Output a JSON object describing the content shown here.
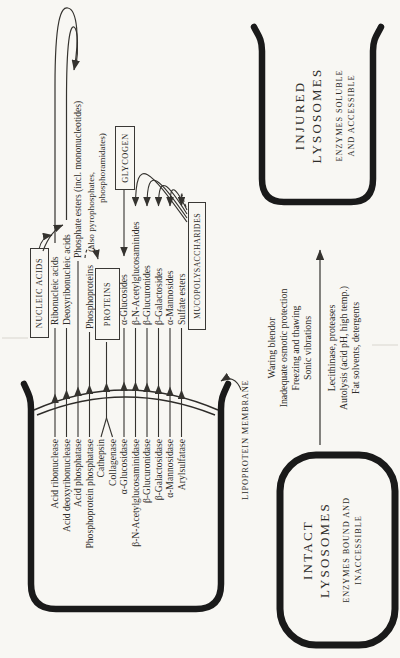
{
  "diagram": {
    "boxes": {
      "nucleic_acids": "NUCLEIC ACIDS",
      "proteins": "PROTEINS",
      "glycogen": "GLYCOGEN",
      "mucopolysaccharides": "MUCOPOLYSACCHARIDES"
    },
    "rows": [
      {
        "enzyme": "Acid ribonuclease",
        "substrate": "Ribonucleic acids"
      },
      {
        "enzyme": "Acid deoxyribonuclease",
        "substrate": "Deoxyribonucleic acids"
      },
      {
        "enzyme": "Acid phosphatase",
        "substrate": "Phosphate esters (incl. mononucleotides)"
      },
      {
        "enzyme": "Phosphoprotein phosphatase",
        "substrate": "Phosphoproteins"
      },
      {
        "enzyme": "Cathepsin",
        "substrate": ""
      },
      {
        "enzyme": "Collagenase",
        "substrate": ""
      },
      {
        "enzyme": "α-Glucosidase",
        "substrate": "α-Glucosides"
      },
      {
        "enzyme": "β-N-Acetylglucosaminidase",
        "substrate": "β-N-Acetylglucosaminides"
      },
      {
        "enzyme": "β-Glucuronidase",
        "substrate": "β-Glucuronides"
      },
      {
        "enzyme": "β-Galactosidase",
        "substrate": "β-Galactosides"
      },
      {
        "enzyme": "α-Mannosidase",
        "substrate": "α-Mannosides"
      },
      {
        "enzyme": "Arylsulfatase",
        "substrate": "Sulfate esters"
      }
    ],
    "phosphate_note1": "(also pyrophosphates,",
    "phosphate_note2": "phosphoramidates)",
    "membrane_label": "LIPOPROTEIN MEMBRANE",
    "intact": {
      "line1": "INTACT",
      "line2": "LYSOSOMES",
      "sub1": "ENZYMES BOUND AND",
      "sub2": "INACCESSIBLE"
    },
    "injured": {
      "line1": "INJURED",
      "line2": "LYSOSOMES",
      "sub1": "ENZYMES SOLUBLE",
      "sub2": "AND ACCESSIBLE"
    },
    "treatments_above": [
      "Waring blendor",
      "Inadequate osmotic protection",
      "Freezing and thawing",
      "Sonic vibrations"
    ],
    "treatments_below": [
      "Lecithinase, proteases",
      "Autolysis (acid pH, high temp.)",
      "Fat solvents, detergents"
    ],
    "colors": {
      "ink": "#1a1a1a",
      "line": "#35332f",
      "paper": "#f8f7f3"
    }
  }
}
